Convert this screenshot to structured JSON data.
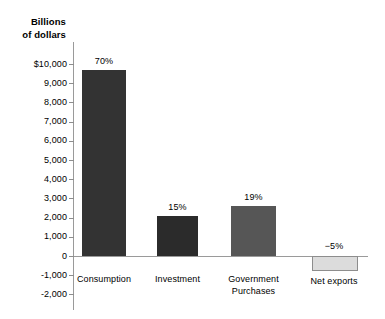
{
  "chart_data": {
    "type": "bar",
    "title": "",
    "axis_title": "Billions\nof dollars",
    "axis_title_line1": "Billions",
    "axis_title_line2": "of dollars",
    "xlabel": "",
    "ylabel": "Billions of dollars",
    "ylim": [
      -2000,
      10000
    ],
    "grid": false,
    "legend": "none",
    "categories": [
      "Consumption",
      "Investment",
      "Government Purchases",
      "Net exports"
    ],
    "values": [
      9700,
      2100,
      2600,
      -700
    ],
    "data_labels": [
      "70%",
      "15%",
      "19%",
      "−5%"
    ],
    "series": [
      {
        "name": "Components of GDP",
        "values": [
          9700,
          2100,
          2600,
          -700
        ]
      }
    ],
    "ytick_labels": [
      "$10,000",
      "9,000",
      "8,000",
      "7,000",
      "6,000",
      "5,000",
      "4,000",
      "3,000",
      "2,000",
      "1,000",
      "0",
      "-1,000",
      "-2,000"
    ],
    "ytick_values": [
      10000,
      9000,
      8000,
      7000,
      6000,
      5000,
      4000,
      3000,
      2000,
      1000,
      0,
      -1000,
      -2000
    ],
    "bar_colors": [
      "#333333",
      "#2b2b2b",
      "#565656",
      "#dcdcdc"
    ],
    "category_labels": [
      {
        "line1": "Consumption",
        "line2": ""
      },
      {
        "line1": "Investment",
        "line2": ""
      },
      {
        "line1": "Government",
        "line2": "Purchases"
      },
      {
        "line1": "Net exports",
        "line2": ""
      }
    ]
  },
  "colors": {
    "axis": "#9a9a9a",
    "tick": "#8d8d8d",
    "text": "#000000",
    "background": "#ffffff",
    "bar_consumption": "#333333",
    "bar_investment": "#2b2b2b",
    "bar_government": "#565656",
    "bar_net_exports": "#dcdcdc",
    "bar_net_exports_border": "#8d8d8d"
  }
}
